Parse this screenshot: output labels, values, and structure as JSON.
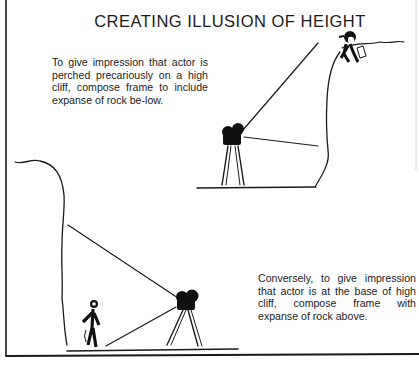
{
  "title": "CREATING ILLUSION OF HEIGHT",
  "captions": {
    "top": "To give impression that actor is perched precariously on a high cliff, compose frame to include expanse of rock be-low.",
    "bottom": "Conversely, to give impression that actor is at the base of high cliff, compose frame with expanse of rock above."
  },
  "illustrations": {
    "top": {
      "subject": "actor-on-cliff-top",
      "camera": "movie-camera-on-tripod",
      "angle": "high-cliff-from-below-level"
    },
    "bottom": {
      "subject": "actor-at-cliff-base",
      "camera": "movie-camera-on-tripod",
      "angle": "looking-up-at-cliff"
    }
  },
  "colors": {
    "ink": "#1a1a1a",
    "paper": "#ffffff"
  }
}
